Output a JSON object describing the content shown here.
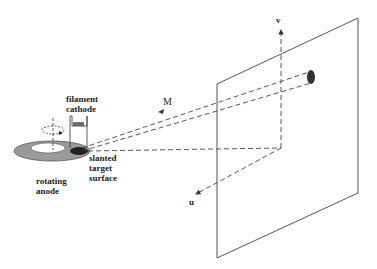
{
  "diagram": {
    "labels": {
      "filament_cathode_line1": "filament",
      "filament_cathode_line2": "cathode",
      "slanted_target_line1": "slanted",
      "slanted_target_line2": "target",
      "slanted_target_line3": "surface",
      "rotating_anode_line1": "rotating",
      "rotating_anode_line2": "anode",
      "magnification": "M",
      "axis_v": "v",
      "axis_u": "u"
    },
    "colors": {
      "line": "#333333",
      "anode_ring": "#999999",
      "focal_spot": "#222222",
      "background": "#ffffff"
    }
  }
}
